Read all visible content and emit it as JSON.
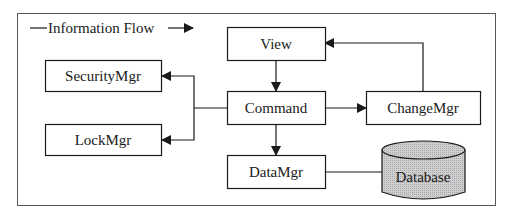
{
  "legend": {
    "label": "Information Flow"
  },
  "nodes": {
    "view": "View",
    "security": "SecurityMgr",
    "command": "Command",
    "change": "ChangeMgr",
    "lock": "LockMgr",
    "data": "DataMgr",
    "database": "Database"
  },
  "edges": [
    {
      "from": "View",
      "to": "Command"
    },
    {
      "from": "Command",
      "to": "SecurityMgr"
    },
    {
      "from": "Command",
      "to": "LockMgr"
    },
    {
      "from": "Command",
      "to": "ChangeMgr"
    },
    {
      "from": "ChangeMgr",
      "to": "View"
    },
    {
      "from": "Command",
      "to": "DataMgr"
    },
    {
      "from": "DataMgr",
      "to": "Database",
      "arrow": false
    }
  ],
  "colors": {
    "line": "#1a1a1a",
    "database_fill": "#c8c8c8",
    "frame": "#555555"
  }
}
